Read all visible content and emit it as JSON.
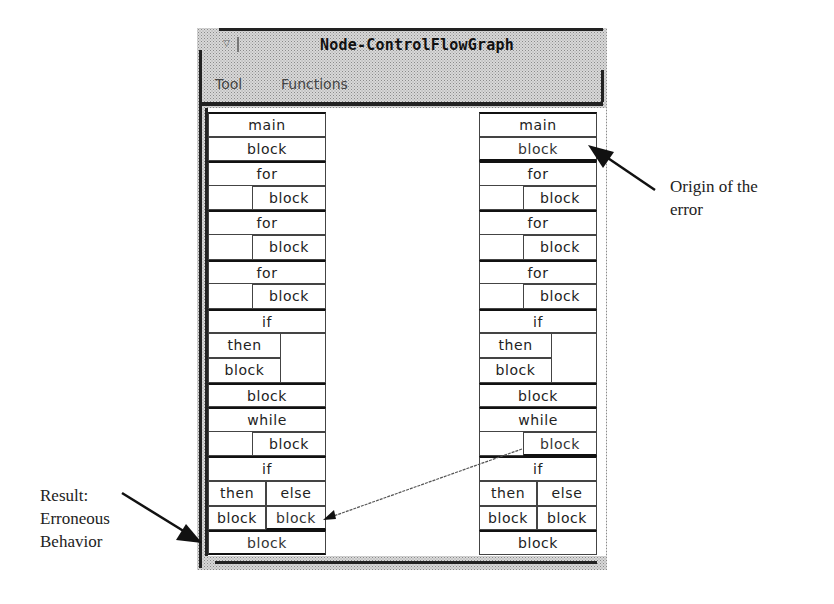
{
  "window": {
    "title": "Node-ControlFlowGraph",
    "close_glyph": "▽",
    "menu": [
      {
        "label": "Tool"
      },
      {
        "label": "Functions"
      }
    ]
  },
  "left_tree": {
    "rows": [
      {
        "id": "main",
        "label": "main"
      },
      {
        "id": "block1",
        "label": "block"
      },
      {
        "id": "for1",
        "label": "for"
      },
      {
        "id": "for1-block",
        "label": "block"
      },
      {
        "id": "for2",
        "label": "for"
      },
      {
        "id": "for2-block",
        "label": "block"
      },
      {
        "id": "for3",
        "label": "for"
      },
      {
        "id": "for3-block",
        "label": "block"
      },
      {
        "id": "if1",
        "label": "if"
      },
      {
        "id": "if1-then",
        "label": "then"
      },
      {
        "id": "if1-then-block",
        "label": "block"
      },
      {
        "id": "block2",
        "label": "block"
      },
      {
        "id": "while",
        "label": "while"
      },
      {
        "id": "while-block",
        "label": "block"
      },
      {
        "id": "if2",
        "label": "if"
      },
      {
        "id": "if2-then",
        "label": "then"
      },
      {
        "id": "if2-else",
        "label": "else"
      },
      {
        "id": "if2-then-block",
        "label": "block"
      },
      {
        "id": "if2-else-block",
        "label": "block",
        "highlighted": true
      },
      {
        "id": "block3",
        "label": "block",
        "highlighted": true
      }
    ]
  },
  "right_tree": {
    "rows": [
      {
        "id": "main",
        "label": "main"
      },
      {
        "id": "block1",
        "label": "block",
        "highlighted": true
      },
      {
        "id": "for1",
        "label": "for"
      },
      {
        "id": "for1-block",
        "label": "block"
      },
      {
        "id": "for2",
        "label": "for"
      },
      {
        "id": "for2-block",
        "label": "block"
      },
      {
        "id": "for3",
        "label": "for"
      },
      {
        "id": "for3-block",
        "label": "block"
      },
      {
        "id": "if1",
        "label": "if"
      },
      {
        "id": "if1-then",
        "label": "then"
      },
      {
        "id": "if1-then-block",
        "label": "block"
      },
      {
        "id": "block2",
        "label": "block"
      },
      {
        "id": "while",
        "label": "while"
      },
      {
        "id": "while-block",
        "label": "block",
        "highlighted": true
      },
      {
        "id": "if2",
        "label": "if"
      },
      {
        "id": "if2-then",
        "label": "then"
      },
      {
        "id": "if2-else",
        "label": "else"
      },
      {
        "id": "if2-then-block",
        "label": "block"
      },
      {
        "id": "if2-else-block",
        "label": "block"
      },
      {
        "id": "block3",
        "label": "block"
      }
    ]
  },
  "annotations": {
    "origin": {
      "line1": "Origin of the",
      "line2": "error"
    },
    "result": {
      "line1": "Result:",
      "line2": "Erroneous",
      "line3": "Behavior"
    }
  }
}
